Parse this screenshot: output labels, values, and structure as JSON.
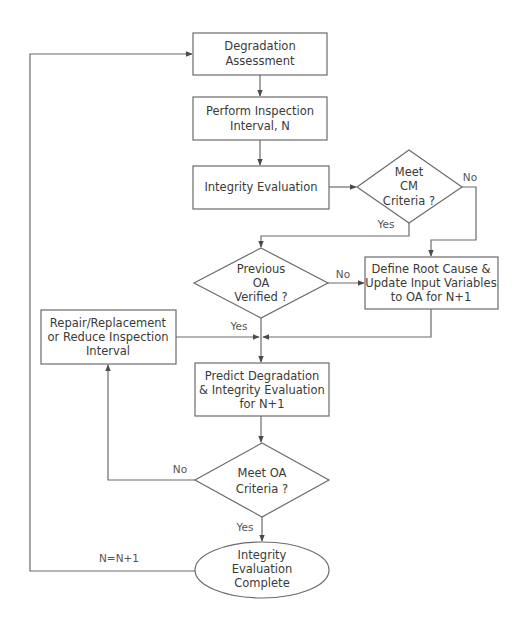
{
  "diagram": {
    "type": "flowchart",
    "nodes": {
      "degradation_assessment": {
        "shape": "rect",
        "lines": [
          "Degradation",
          "Assessment"
        ]
      },
      "perform_inspection": {
        "shape": "rect",
        "lines": [
          "Perform Inspection",
          "Interval, N"
        ]
      },
      "integrity_evaluation": {
        "shape": "rect",
        "lines": [
          "Integrity Evaluation"
        ]
      },
      "meet_cm_criteria": {
        "shape": "diamond",
        "lines": [
          "Meet",
          "CM",
          "Criteria ?"
        ]
      },
      "previous_oa_verified": {
        "shape": "diamond",
        "lines": [
          "Previous",
          "OA",
          "Verified ?"
        ]
      },
      "define_root_cause": {
        "shape": "rect",
        "lines": [
          "Define Root Cause &",
          "Update Input Variables",
          "to OA for N+1"
        ]
      },
      "repair_replacement": {
        "shape": "rect",
        "lines": [
          "Repair/Replacement",
          "or Reduce Inspection",
          "Interval"
        ]
      },
      "predict_degradation": {
        "shape": "rect",
        "lines": [
          "Predict Degradation",
          "& Integrity Evaluation",
          "for N+1"
        ]
      },
      "meet_oa_criteria": {
        "shape": "diamond",
        "lines": [
          "Meet OA",
          "Criteria ?"
        ]
      },
      "integrity_complete": {
        "shape": "ellipse",
        "lines": [
          "Integrity",
          "Evaluation",
          "Complete"
        ]
      }
    },
    "edge_labels": {
      "cm_no": "No",
      "cm_yes": "Yes",
      "prev_no": "No",
      "prev_yes": "Yes",
      "oa_no": "No",
      "oa_yes": "Yes",
      "loop": "N=N+1"
    },
    "edges": [
      {
        "from": "degradation_assessment",
        "to": "perform_inspection"
      },
      {
        "from": "perform_inspection",
        "to": "integrity_evaluation"
      },
      {
        "from": "integrity_evaluation",
        "to": "meet_cm_criteria"
      },
      {
        "from": "meet_cm_criteria",
        "to": "define_root_cause",
        "label": "No"
      },
      {
        "from": "meet_cm_criteria",
        "to": "previous_oa_verified",
        "label": "Yes"
      },
      {
        "from": "previous_oa_verified",
        "to": "define_root_cause",
        "label": "No"
      },
      {
        "from": "previous_oa_verified",
        "to": "predict_degradation",
        "label": "Yes"
      },
      {
        "from": "define_root_cause",
        "to": "predict_degradation"
      },
      {
        "from": "repair_replacement",
        "to": "predict_degradation"
      },
      {
        "from": "predict_degradation",
        "to": "meet_oa_criteria"
      },
      {
        "from": "meet_oa_criteria",
        "to": "repair_replacement",
        "label": "No"
      },
      {
        "from": "meet_oa_criteria",
        "to": "integrity_complete",
        "label": "Yes"
      },
      {
        "from": "integrity_complete",
        "to": "degradation_assessment",
        "label": "N=N+1"
      }
    ],
    "colors": {
      "stroke": "#6b6b6b",
      "text": "#3a3a3a",
      "background": "#ffffff"
    }
  }
}
